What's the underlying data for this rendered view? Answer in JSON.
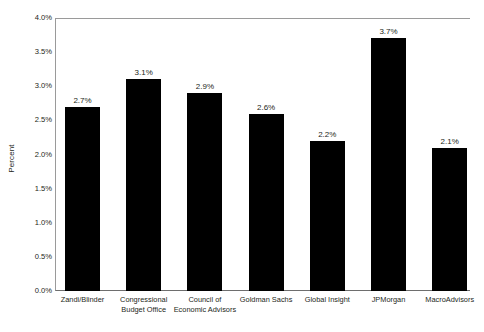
{
  "chart_data": {
    "type": "bar",
    "title": "",
    "subtitle": "",
    "xlabel": "",
    "ylabel": "Percent",
    "categories": [
      "Zandi/Blinder",
      "Congressional Budget Office",
      "Council of Economic Advisors",
      "Goldman Sachs",
      "Global Insight",
      "JPMorgan",
      "MacroAdvisors"
    ],
    "values": [
      2.7,
      3.1,
      2.9,
      2.6,
      2.2,
      3.7,
      2.1
    ],
    "value_labels": [
      "2.7%",
      "3.1%",
      "2.9%",
      "2.6%",
      "2.2%",
      "3.7%",
      "2.1%"
    ],
    "ylim": [
      0.0,
      4.0
    ],
    "ytick_values": [
      0.0,
      0.5,
      1.0,
      1.5,
      2.0,
      2.5,
      3.0,
      3.5,
      4.0
    ],
    "ytick_labels": [
      "0.0%",
      "0.5%",
      "1.0%",
      "1.5%",
      "2.0%",
      "2.5%",
      "3.0%",
      "3.5%",
      "4.0%"
    ],
    "grid": false,
    "legend": false,
    "legend_position": "none",
    "bar_color": "#000000",
    "axis_color": "#9a9a9a",
    "text_color": "#231f20",
    "background_color": "#ffffff"
  }
}
